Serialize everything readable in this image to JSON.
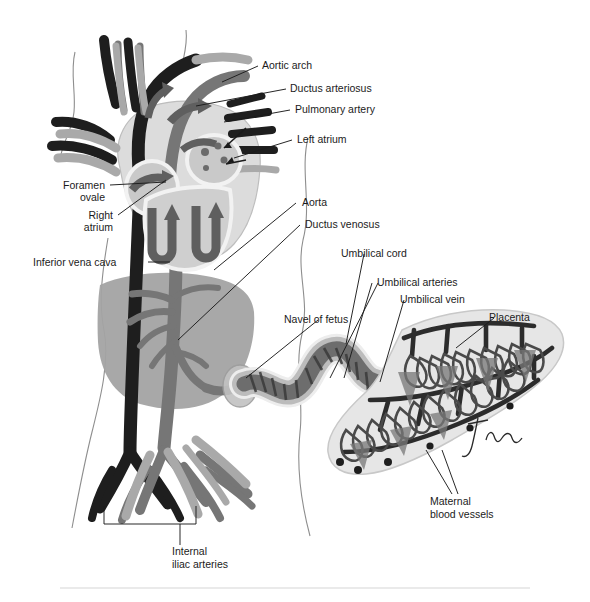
{
  "figure": {
    "signature": "Tina",
    "colors": {
      "deoxygenated_vessel": "#1c1c1c",
      "mixed_vessel": "#6e6e6e",
      "oxygenated_vessel": "#a8a8a8",
      "organ_fill": "#9a9a9a",
      "heart_fill": "#d8d8d8",
      "outline": "#8a8a8a",
      "label_text": "#1b1b1b",
      "separator": "#d3d3d3"
    }
  },
  "labels": {
    "aortic_arch": "Aortic arch",
    "ductus_arteriosus": "Ductus arteriosus",
    "pulmonary_artery": "Pulmonary artery",
    "left_atrium": "Left atrium",
    "foramen_ovale_line1": "Foramen",
    "foramen_ovale_line2": "ovale",
    "right_atrium_line1": "Right",
    "right_atrium_line2": "atrium",
    "inferior_vena_cava": "Inferior vena cava",
    "aorta": "Aorta",
    "ductus_venosus": "Ductus venosus",
    "umbilical_cord": "Umbilical cord",
    "umbilical_arteries": "Umbilical arteries",
    "umbilical_vein": "Umbilical vein",
    "navel_of_fetus": "Navel of fetus",
    "placenta": "Placenta",
    "maternal_line1": "Maternal",
    "maternal_line2": "blood vessels",
    "internal_iliac_line1": "Internal",
    "internal_iliac_line2": "iliac arteries"
  }
}
